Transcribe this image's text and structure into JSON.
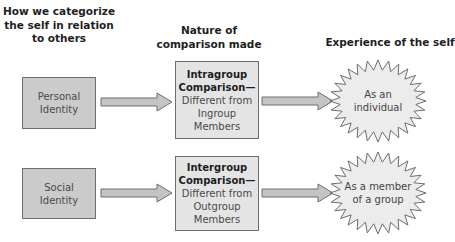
{
  "headers": {
    "categorize": [
      "How we categorize",
      "the self in relation",
      "to others"
    ],
    "comparison": [
      "Nature of",
      "comparison made"
    ],
    "experience": [
      "Experience of the self"
    ]
  },
  "rows": [
    {
      "identity": [
        "Personal",
        "Identity"
      ],
      "comparison_bold": [
        "Intragroup",
        "Comparison—"
      ],
      "comparison_text": [
        "Different from",
        "Ingroup",
        "Members"
      ],
      "experience": [
        "As an",
        "individual"
      ]
    },
    {
      "identity": [
        "Social",
        "Identity"
      ],
      "comparison_bold": [
        "Intergroup",
        "Comparison—"
      ],
      "comparison_text": [
        "Different from",
        "Outgroup",
        "Members"
      ],
      "experience": [
        "As a member",
        "of a group"
      ]
    }
  ],
  "colors": {
    "identity_box": "#cbcbcb",
    "comparison_box": "#e4e4e4",
    "arrow_fill": "#c4c4c4",
    "burst_fill": "#ececec",
    "stroke": "#6e6e6e"
  }
}
